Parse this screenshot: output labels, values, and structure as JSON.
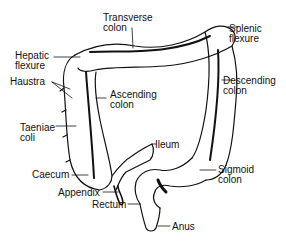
{
  "diagram": {
    "labels": {
      "transverse_colon": [
        "Transverse",
        "colon"
      ],
      "splenic_flexure": [
        "Splenic",
        "flexure"
      ],
      "hepatic_flexure": [
        "Hepatic",
        "flexure"
      ],
      "haustra": [
        "Haustra"
      ],
      "ascending_colon": [
        "Ascending",
        "colon"
      ],
      "descending_colon": [
        "Descending",
        "colon"
      ],
      "taeniae_coli": [
        "Taeniae",
        "coli"
      ],
      "ileum": [
        "Ileum"
      ],
      "caecum": [
        "Caecum"
      ],
      "appendix": [
        "Appendix"
      ],
      "sigmoid_colon": [
        "Sigmoid",
        "colon"
      ],
      "rectum": [
        "Rectum"
      ],
      "anus": [
        "Anus"
      ]
    },
    "colors": {
      "ink": "#111111",
      "background": "#ffffff"
    }
  }
}
